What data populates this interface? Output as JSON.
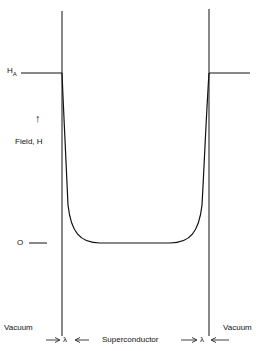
{
  "diagram": {
    "labels": {
      "applied_field": "H",
      "applied_field_sub": "A",
      "axis_arrow": "↑",
      "axis_label": "Field, H",
      "zero": "O",
      "vacuum_left": "Vacuum",
      "vacuum_right": "Vacuum",
      "superconductor": "Superconductor",
      "lambda_left": "λ",
      "lambda_right": "λ"
    },
    "colors": {
      "line": "#111111",
      "background": "#ffffff"
    }
  }
}
